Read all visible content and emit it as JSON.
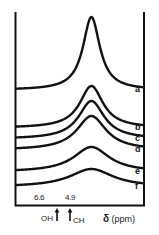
{
  "figure": {
    "background_color": "#ffffff",
    "line_color": "#111111"
  },
  "axis": {
    "title_symbol": "δ",
    "title_units": "(ppm)",
    "tick_labels": [
      {
        "text": "6.6",
        "x": 40
      },
      {
        "text": "4.9",
        "x": 70
      }
    ],
    "assignments": [
      {
        "text": "OH",
        "arrow": "↑",
        "order": "label-then-arrow",
        "x": 30
      },
      {
        "text": "CH",
        "arrow": "↑",
        "order": "arrow-then-label",
        "x": 68
      }
    ]
  },
  "traces": [
    {
      "label": "a",
      "y": 89
    },
    {
      "label": "b",
      "y": 127
    },
    {
      "label": "c",
      "y": 138
    },
    {
      "label": "d",
      "y": 149
    },
    {
      "label": "e",
      "y": 171
    },
    {
      "label": "f",
      "y": 186
    }
  ],
  "chart_data": {
    "type": "line",
    "title": "",
    "xlabel": "δ (ppm)",
    "ylabel": "",
    "grid": false,
    "legend_position": "right-inline",
    "xlim": [
      8.2,
      2.6
    ],
    "x_tick_values": [
      6.6,
      4.9
    ],
    "x_tick_labels": [
      "6.6",
      "4.9"
    ],
    "annotations": [
      {
        "text": "OH",
        "x": 6.6,
        "marker": "up-arrow"
      },
      {
        "text": "CH",
        "x": 4.9,
        "marker": "up-arrow"
      }
    ],
    "series": [
      {
        "name": "a",
        "baseline": 90,
        "peak_center_ppm": 4.9,
        "peak_height": 73,
        "peak_halfwidth_ppm": 0.45,
        "x": [
          8.2,
          7.6,
          7.0,
          6.6,
          6.2,
          5.8,
          5.5,
          5.2,
          5.0,
          4.9,
          4.8,
          4.6,
          4.4,
          4.1,
          3.8,
          3.4,
          3.0,
          2.6
        ],
        "y": [
          2,
          3,
          5,
          7,
          10,
          16,
          25,
          45,
          65,
          73,
          64,
          40,
          22,
          12,
          7,
          4,
          2,
          1
        ]
      },
      {
        "name": "b",
        "baseline": 128,
        "peak_center_ppm": 4.9,
        "peak_height": 42,
        "peak_halfwidth_ppm": 0.62,
        "x": [
          8.2,
          7.6,
          7.0,
          6.6,
          6.2,
          5.8,
          5.5,
          5.2,
          5.0,
          4.9,
          4.8,
          4.6,
          4.4,
          4.1,
          3.8,
          3.4,
          3.0,
          2.6
        ],
        "y": [
          2,
          3,
          5,
          8,
          12,
          18,
          26,
          36,
          40,
          42,
          39,
          30,
          20,
          12,
          7,
          4,
          2,
          1
        ]
      },
      {
        "name": "c",
        "baseline": 139,
        "peak_center_ppm": 4.9,
        "peak_height": 38,
        "peak_halfwidth_ppm": 0.68,
        "x": [
          8.2,
          7.6,
          7.0,
          6.6,
          6.2,
          5.8,
          5.5,
          5.2,
          5.0,
          4.9,
          4.8,
          4.6,
          4.4,
          4.1,
          3.8,
          3.4,
          3.0,
          2.6
        ],
        "y": [
          2,
          3,
          5,
          8,
          12,
          18,
          25,
          33,
          36,
          38,
          36,
          28,
          19,
          12,
          7,
          4,
          2,
          1
        ]
      },
      {
        "name": "d",
        "baseline": 150,
        "peak_center_ppm": 4.9,
        "peak_height": 34,
        "peak_halfwidth_ppm": 0.78,
        "x": [
          8.2,
          7.6,
          7.0,
          6.6,
          6.2,
          5.8,
          5.5,
          5.2,
          5.0,
          4.9,
          4.8,
          4.6,
          4.4,
          4.1,
          3.8,
          3.4,
          3.0,
          2.6
        ],
        "y": [
          2,
          3,
          6,
          9,
          13,
          19,
          25,
          31,
          33,
          34,
          32,
          26,
          19,
          13,
          8,
          5,
          3,
          2
        ]
      },
      {
        "name": "e",
        "baseline": 172,
        "peak_center_ppm": 4.9,
        "peak_height": 25,
        "peak_halfwidth_ppm": 0.95,
        "x": [
          8.2,
          7.6,
          7.0,
          6.6,
          6.2,
          5.8,
          5.5,
          5.2,
          5.0,
          4.9,
          4.8,
          4.6,
          4.4,
          4.1,
          3.8,
          3.4,
          3.0,
          2.6
        ],
        "y": [
          2,
          3,
          5,
          8,
          11,
          15,
          19,
          23,
          24,
          25,
          24,
          21,
          17,
          12,
          8,
          5,
          3,
          2
        ]
      },
      {
        "name": "f",
        "baseline": 187,
        "peak_center_ppm": 4.9,
        "peak_height": 18,
        "peak_halfwidth_ppm": 1.15,
        "x": [
          8.2,
          7.6,
          7.0,
          6.6,
          6.2,
          5.8,
          5.5,
          5.2,
          5.0,
          4.9,
          4.8,
          4.6,
          4.4,
          4.1,
          3.8,
          3.4,
          3.0,
          2.6
        ],
        "y": [
          1,
          2,
          4,
          6,
          8,
          11,
          14,
          17,
          18,
          18,
          17,
          15,
          12,
          9,
          6,
          4,
          2,
          1
        ]
      }
    ]
  }
}
